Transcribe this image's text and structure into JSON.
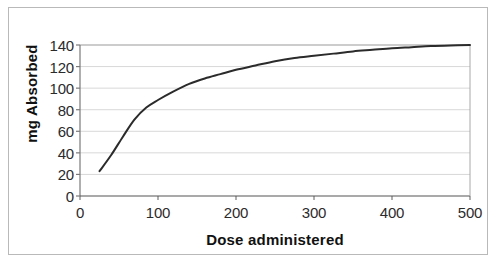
{
  "chart_data": {
    "type": "line",
    "title": "",
    "xlabel": "Dose administered",
    "ylabel": "mg Absorbed",
    "xlim": [
      0,
      500
    ],
    "ylim": [
      0,
      140
    ],
    "xticks": [
      "0",
      "100",
      "200",
      "300",
      "400",
      "500"
    ],
    "yticks": [
      "0",
      "20",
      "40",
      "60",
      "80",
      "100",
      "120",
      "140"
    ],
    "xtick_values": [
      0,
      100,
      200,
      300,
      400,
      500
    ],
    "ytick_values": [
      0,
      20,
      40,
      60,
      80,
      100,
      120,
      140
    ],
    "grid": "horizontal",
    "legend": "none",
    "series": [
      {
        "name": "Absorption",
        "color": "#2b2b2b",
        "line_width": 2,
        "x": [
          25,
          40,
          55,
          70,
          85,
          100,
          120,
          140,
          160,
          180,
          200,
          225,
          250,
          275,
          300,
          325,
          350,
          375,
          400,
          425,
          450,
          475,
          500
        ],
        "y": [
          23,
          38,
          55,
          71,
          82,
          89,
          97,
          104,
          109,
          113,
          117,
          121,
          125,
          128,
          130,
          132,
          134,
          135.5,
          137,
          138,
          139,
          139.6,
          140
        ]
      }
    ]
  },
  "axis": {
    "ylabel": "mg Absorbed",
    "xlabel": "Dose administered"
  },
  "colors": {
    "curve": "#2b2b2b",
    "gridline": "#d8d8d8",
    "axis": "#808080",
    "frame": "#b9b9b9",
    "background": "#ffffff",
    "tick_text": "#2b2b2b"
  }
}
